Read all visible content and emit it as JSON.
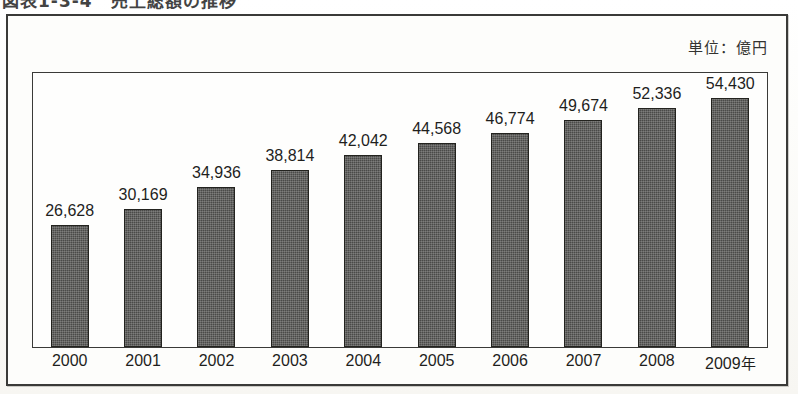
{
  "figure": {
    "title": "図表1-3-4　売上総額の推移",
    "unit_label": "単位：億円",
    "year_suffix": "年"
  },
  "colors": {
    "bar_fill": "#4a4a48",
    "bar_border": "#23231f",
    "frame": "#3a3a38",
    "text": "#1f1f1d",
    "paper": "#fdfdfb"
  },
  "chart_data": {
    "type": "bar",
    "title": "図表1-3-4　売上総額の推移",
    "xlabel": "",
    "ylabel": "",
    "unit": "億円",
    "grid": false,
    "legend": false,
    "ylim": [
      0,
      60000
    ],
    "categories": [
      "2000",
      "2001",
      "2002",
      "2003",
      "2004",
      "2005",
      "2006",
      "2007",
      "2008",
      "2009"
    ],
    "values": [
      26628,
      30169,
      34936,
      38814,
      42042,
      44568,
      46774,
      49674,
      52336,
      54430
    ],
    "data_labels": [
      "26,628",
      "30,169",
      "34,936",
      "38,814",
      "42,042",
      "44,568",
      "46,774",
      "49,674",
      "52,336",
      "54,430"
    ],
    "tick_labels": [
      "2000",
      "2001",
      "2002",
      "2003",
      "2004",
      "2005",
      "2006",
      "2007",
      "2008",
      "2009年"
    ]
  }
}
